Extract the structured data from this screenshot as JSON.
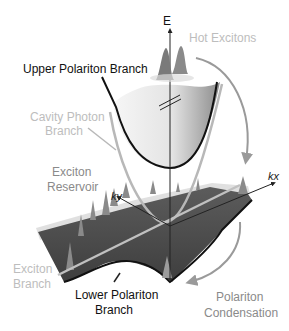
{
  "diagram": {
    "axes": {
      "energy": "E",
      "ky": "ky",
      "kx": "kx"
    },
    "labels": {
      "hot_excitons": "Hot Excitons",
      "upper_polariton": "Upper Polariton Branch",
      "cavity_photon_line1": "Cavity Photon",
      "cavity_photon_line2": "Branch",
      "exciton_reservoir_line1": "Exciton",
      "exciton_reservoir_line2": "Reservoir",
      "exciton_branch_line1": "Exciton",
      "exciton_branch_line2": "Branch",
      "lower_polariton_line1": "Lower Polariton",
      "lower_polariton_line2": "Branch",
      "condensation_line1": "Polariton",
      "condensation_line2": "Condensation"
    },
    "colors": {
      "background": "#ffffff",
      "upper_branch": "#111111",
      "cavity_photon": "#b8b8b8",
      "exciton_plane": "#4a4a4a",
      "arrow": "#9a9a9a",
      "label_light": "#bdbdbd",
      "label_dark": "#111111"
    }
  }
}
